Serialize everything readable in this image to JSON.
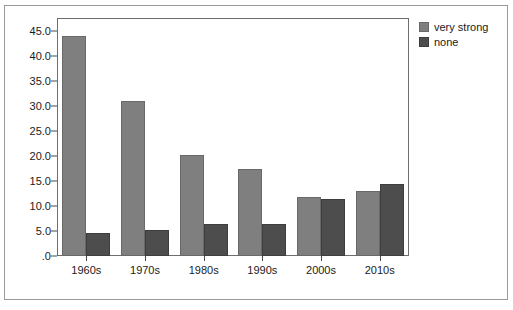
{
  "chart_data": {
    "type": "bar",
    "title": "",
    "subtitle": "",
    "xlabel": "",
    "ylabel": "",
    "categories": [
      "1960s",
      "1970s",
      "1980s",
      "1990s",
      "2000s",
      "2010s"
    ],
    "series": [
      {
        "name": "very strong",
        "color": "#7f7f7f",
        "values": [
          44.0,
          31.0,
          20.1,
          17.3,
          11.8,
          13.0
        ]
      },
      {
        "name": "none",
        "color": "#4d4d4d",
        "values": [
          4.6,
          5.2,
          6.4,
          6.4,
          11.4,
          14.4
        ]
      }
    ],
    "ylim": [
      0,
      47.5
    ],
    "yticks": [
      0,
      5,
      10,
      15,
      20,
      25,
      30,
      35,
      40,
      45
    ],
    "ytick_labels": [
      ".0",
      "5.0",
      "10.0",
      "15.0",
      "20.0",
      "25.0",
      "30.0",
      "35.0",
      "40.0",
      "45.0"
    ],
    "grid": false,
    "legend_position": "right-outside",
    "legend_entries": [
      "very strong",
      "none"
    ],
    "annotations": []
  }
}
